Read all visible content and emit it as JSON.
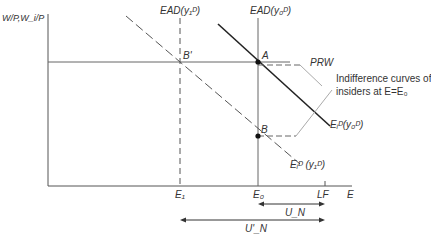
{
  "diagram": {
    "y_axis_label": "W/P,W_i/P",
    "x_axis_label": "E",
    "ticks": {
      "e1": "E₁",
      "e0": "E₀",
      "lf": "LF"
    },
    "curves": {
      "ead_y1": "EAD(y₁ᴰ)",
      "ead_y0": "EAD(y₀ᴰ)",
      "ed_y0": "Eᵢᴰ(y₀ᴰ)",
      "ed_y1": "Eᵢᴰ (y₁ᴰ)",
      "prw": "PRW"
    },
    "points": {
      "a": "A",
      "b": "B",
      "b_prime": "B'"
    },
    "annotation": {
      "line1": "Indifference curves of",
      "line2": "insiders at E=E₀"
    },
    "ranges": {
      "un": "U_N",
      "un_prime": "U'_N"
    }
  }
}
